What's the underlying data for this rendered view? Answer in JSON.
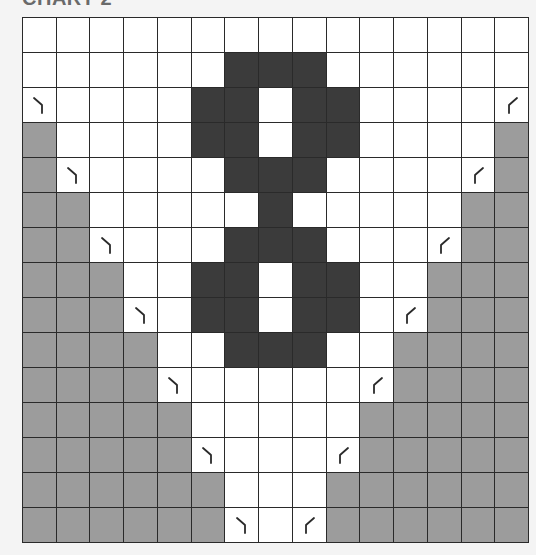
{
  "title": "CHART 2",
  "legend_codes": {
    "W": "white-square",
    "D": "dark-square",
    "G": "gray-square",
    "L": "left-leaning-decrease-symbol",
    "R": "right-leaning-decrease-symbol"
  },
  "colors": {
    "white": "#ffffff",
    "dark": "#3b3b3b",
    "gray": "#9c9c9c",
    "gridline": "#2a2a2a",
    "background": "#f4f4f4"
  },
  "grid": {
    "columns": 15,
    "rows_count": 15,
    "rows": [
      "WWWWWWWWWWWWWWW",
      "WWWWWWDDDWWWWWW",
      "LWWWWDDWDDWWWWR",
      "GWWWWDDWDDWWWWG",
      "GLWWWWDDDWWWWRG",
      "GGWWWWWDWWWWWGG",
      "GGLWWWDDDWWWRGG",
      "GGGWWDDWDDWWGGG",
      "GGGLWDDWDDWRGGG",
      "GGGGWWDDDWWGGGG",
      "GGGGLWWWWWRGGGG",
      "GGGGGWWWWWGGGGG",
      "GGGGGLWWWRGGGGG",
      "GGGGGGWWWGGGGGG",
      "GGGGGGLWRGGGGGG"
    ]
  }
}
